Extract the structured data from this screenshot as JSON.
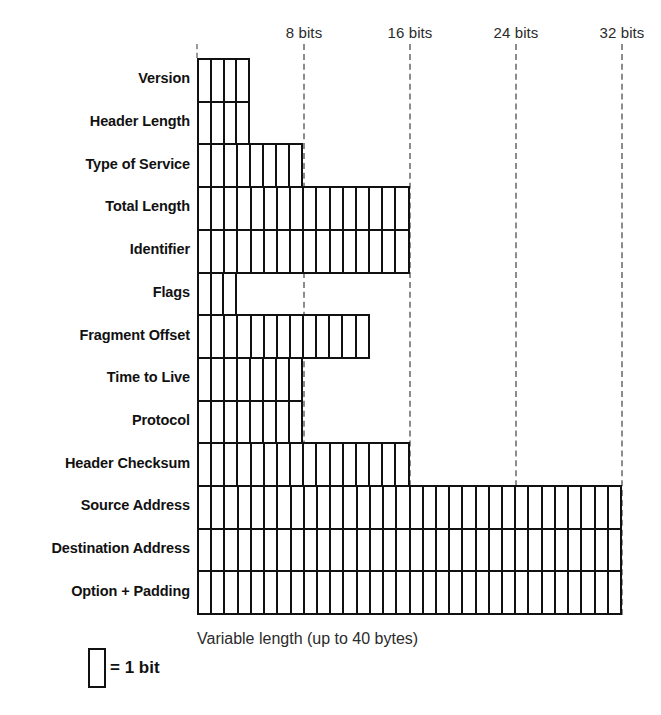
{
  "diagram": {
    "geometry": {
      "grid_left": 197,
      "grid_right": 622,
      "grid_top": 58,
      "row_height": 42.7,
      "total_bits": 32
    },
    "axis": {
      "ticks": [
        {
          "label": "8 bits",
          "bit": 8,
          "x": 304
        },
        {
          "label": "16 bits",
          "bit": 16,
          "x": 410
        },
        {
          "label": "24 bits",
          "bit": 24,
          "x": 516
        },
        {
          "label": "32 bits",
          "bit": 32,
          "x": 622
        }
      ],
      "origin_tick": {
        "label": "",
        "bit": 0,
        "x": 197
      }
    },
    "rows": [
      {
        "label": "Version",
        "bits": 4
      },
      {
        "label": "Header Length",
        "bits": 4
      },
      {
        "label": "Type of Service",
        "bits": 8
      },
      {
        "label": "Total Length",
        "bits": 16
      },
      {
        "label": "Identifier",
        "bits": 16
      },
      {
        "label": "Flags",
        "bits": 3
      },
      {
        "label": "Fragment Offset",
        "bits": 13
      },
      {
        "label": "Time to Live",
        "bits": 8
      },
      {
        "label": "Protocol",
        "bits": 8
      },
      {
        "label": "Header Checksum",
        "bits": 16
      },
      {
        "label": "Source Address",
        "bits": 32
      },
      {
        "label": "Destination Address",
        "bits": 32
      },
      {
        "label": "Option + Padding",
        "bits": 32
      }
    ],
    "legend": {
      "symbol_text": "= 1 bit"
    },
    "note": "Variable length (up to 40 bytes)",
    "colors": {
      "line": "#111111",
      "guide": "#8c8c8c",
      "background": "#ffffff",
      "text": "#1a1a1a"
    }
  }
}
